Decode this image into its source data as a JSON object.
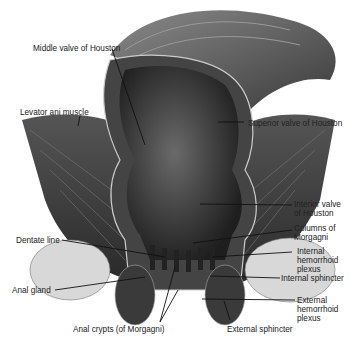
{
  "diagram": {
    "labels": {
      "middle_valve": "Middle valve of Houston",
      "levator_ani": "Levator ani muscle",
      "superior_valve": "Superior valve of Houston",
      "inferior_valve_l1": "Interior valve",
      "inferior_valve_l2": "of Houston",
      "dentate_line": "Dentate line",
      "columns_l1": "Columns of",
      "columns_l2": "Morgagni",
      "int_hem_l1": "Internal",
      "int_hem_l2": "hemorrhoid",
      "int_hem_l3": "plexus",
      "internal_sphincter": "Internal sphincter",
      "anal_gland": "Anal gland",
      "ext_hem_l1": "External",
      "ext_hem_l2": "hemorrhoid",
      "ext_hem_l3": "plexus",
      "anal_crypts": "Anal crypts (of Morgagni)",
      "external_sphincter": "External sphincter"
    }
  }
}
